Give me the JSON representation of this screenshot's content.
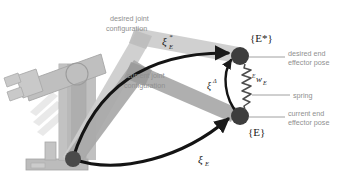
{
  "figure": {
    "background_color": "#ffffff",
    "width": 342,
    "height": 179
  },
  "colors": {
    "robot_body": "#b4b4b4",
    "robot_body_dark": "#a0a0a0",
    "shadow": "#cfcfcf",
    "desired_arm": "#c8c8c8",
    "current_arm": "#9e9e9e",
    "stroke_dark": "#1a1a1a",
    "joint_fill": "#4a4a4a",
    "label_gray": "#8f8f8f",
    "leader_line": "#9a9a9a",
    "spring": "#555555"
  },
  "annotations": {
    "desired_joint_configuration": "desired joint\nconfiguration",
    "desired_joint_configuration_line1": "desired joint",
    "desired_joint_configuration_line2": "configuration",
    "current_joint_configuration_line1": "current joint",
    "current_joint_configuration_line2": "configuration",
    "desired_end_effector_pose_line1": "desired end",
    "desired_end_effector_pose_line2": "effector pose",
    "current_end_effector_pose_line1": "current end",
    "current_end_effector_pose_line2": "effector pose",
    "spring": "spring"
  },
  "math_labels": {
    "xi_star_E_base": "ξ",
    "xi_star_E_sup": "*",
    "xi_star_E_sub": "E",
    "xi_delta_base": "ξ",
    "xi_delta_sup": "Δ",
    "xi_E_base": "ξ",
    "xi_E_sub": "E",
    "w_E_sup": "E",
    "w_E_base": "w",
    "w_E_sub": "E"
  },
  "frames": {
    "desired_frame": "{E*}",
    "current_frame": "{E}"
  },
  "geometry": {
    "base_joint": {
      "x": 73,
      "y": 159
    },
    "desired_end_effector": {
      "x": 240,
      "y": 56
    },
    "current_end_effector": {
      "x": 240,
      "y": 116
    },
    "elbow_joint": {
      "x": 143,
      "y": 55
    }
  }
}
